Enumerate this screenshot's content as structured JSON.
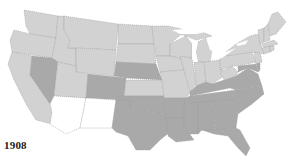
{
  "map": {
    "year_label": "1908",
    "colors": {
      "light": "#d2d2d2",
      "medium": "#a9a9a9",
      "territory": "#ffffff",
      "water": "#ffffff",
      "border": "#9a9a9a"
    },
    "categories": [
      {
        "name": "light",
        "states": [
          "WA",
          "OR",
          "CA",
          "ID",
          "MT",
          "WY",
          "UT",
          "ND",
          "SD",
          "KS",
          "MN",
          "IA",
          "MO",
          "WI",
          "IL",
          "MI",
          "IN",
          "OH",
          "PA",
          "NY",
          "VT",
          "NH",
          "ME",
          "MA",
          "CT",
          "RI",
          "NJ",
          "WV"
        ]
      },
      {
        "name": "medium",
        "states": [
          "NV",
          "CO",
          "NE",
          "OK",
          "TX",
          "AR",
          "LA",
          "MS",
          "AL",
          "GA",
          "FL",
          "SC",
          "NC",
          "TN",
          "KY",
          "VA",
          "MD",
          "DE"
        ]
      },
      {
        "name": "territory",
        "states": [
          "AZ",
          "NM"
        ]
      }
    ]
  }
}
